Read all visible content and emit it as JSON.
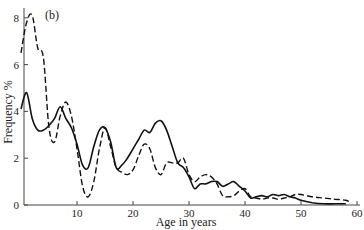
{
  "chart_data": {
    "type": "line",
    "title": "",
    "panel_label": "(b)",
    "xlabel": "Age in years",
    "ylabel": "Frequency %",
    "xlim": [
      0,
      60
    ],
    "ylim": [
      0,
      8.2
    ],
    "xticks": [
      10,
      20,
      30,
      40,
      50,
      60
    ],
    "yticks": [
      0,
      2,
      4,
      6,
      8
    ],
    "grid": false,
    "legend": null,
    "series": [
      {
        "name": "solid",
        "style": "solid",
        "x": [
          0,
          1,
          2,
          3,
          4,
          5,
          6,
          7,
          8,
          9,
          10,
          11,
          12,
          13,
          14,
          15,
          16,
          17,
          18,
          19,
          20,
          21,
          22,
          23,
          24,
          25,
          26,
          27,
          28,
          29,
          30,
          31,
          32,
          33,
          34,
          35,
          36,
          37,
          38,
          39,
          40,
          41,
          42,
          43,
          44,
          45,
          46,
          47,
          48,
          49,
          50,
          52,
          54,
          56,
          58
        ],
        "values": [
          4.1,
          4.8,
          3.7,
          3.2,
          3.2,
          3.4,
          3.7,
          4.2,
          3.7,
          3.3,
          2.6,
          1.7,
          1.6,
          2.5,
          3.2,
          3.3,
          2.7,
          1.6,
          1.7,
          2.0,
          2.4,
          2.8,
          3.2,
          3.1,
          3.5,
          3.6,
          3.2,
          2.5,
          1.8,
          1.6,
          1.2,
          0.7,
          0.9,
          0.9,
          1.0,
          1.0,
          0.8,
          0.9,
          1.0,
          0.8,
          0.6,
          0.3,
          0.35,
          0.4,
          0.35,
          0.45,
          0.4,
          0.45,
          0.35,
          0.3,
          0.2,
          0.1,
          0.05,
          0.05,
          0.05
        ]
      },
      {
        "name": "dashed",
        "style": "dashed",
        "x": [
          0,
          1,
          2,
          3,
          4,
          5,
          6,
          7,
          8,
          9,
          10,
          11,
          12,
          13,
          14,
          15,
          16,
          17,
          18,
          19,
          20,
          21,
          22,
          23,
          24,
          25,
          26,
          27,
          28,
          29,
          30,
          31,
          32,
          33,
          34,
          35,
          36,
          37,
          38,
          39,
          40,
          41,
          42,
          43,
          44,
          45,
          46,
          47,
          48,
          49,
          50,
          52,
          54,
          56,
          58,
          59
        ],
        "values": [
          6.5,
          7.8,
          8.1,
          6.7,
          6.3,
          3.3,
          2.7,
          3.8,
          4.4,
          3.8,
          2.4,
          0.8,
          0.35,
          1.0,
          2.4,
          3.3,
          2.5,
          1.6,
          1.4,
          1.3,
          1.5,
          2.1,
          2.6,
          2.4,
          1.6,
          1.3,
          1.8,
          1.8,
          1.8,
          2.0,
          1.3,
          1.0,
          1.2,
          1.3,
          1.2,
          0.9,
          0.4,
          0.35,
          0.4,
          0.6,
          0.7,
          0.35,
          0.3,
          0.25,
          0.3,
          0.3,
          0.25,
          0.3,
          0.35,
          0.45,
          0.45,
          0.35,
          0.3,
          0.25,
          0.2,
          0.1
        ]
      }
    ]
  }
}
